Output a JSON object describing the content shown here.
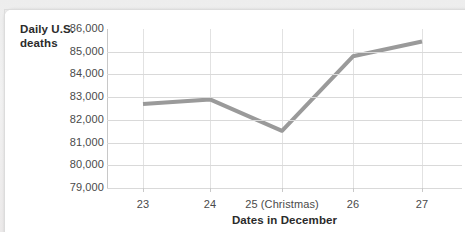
{
  "chart_data": {
    "type": "line",
    "title": "",
    "ylabel": "Daily U.S.\ndeaths",
    "ylabel_line1": "Daily U.S.",
    "ylabel_line2": "deaths",
    "xlabel": "Dates in December",
    "categories": [
      "23",
      "24",
      "25 (Christmas)",
      "26",
      "27"
    ],
    "x_tick_labels": [
      "23",
      "24",
      "25 (Christmas)",
      "26",
      "27"
    ],
    "y_tick_labels": [
      "86,000",
      "85,000",
      "84,000",
      "83,000",
      "82,000",
      "81,000",
      "80,000",
      "79,000"
    ],
    "y_tick_values": [
      86000,
      85000,
      84000,
      83000,
      82000,
      81000,
      80000,
      79000
    ],
    "ylim": [
      79000,
      86000
    ],
    "values": [
      82700,
      82900,
      81520,
      84800,
      85450
    ],
    "series": [
      {
        "name": "Daily U.S. deaths",
        "values": [
          82700,
          82900,
          81520,
          84800,
          85450
        ]
      }
    ],
    "grid": "horizontal-and-vertical",
    "legend": "none",
    "line_color": "#9a9a9a",
    "grid_color": "#d9d9d9",
    "axis_color": "#b9b9b9",
    "text_color": "#4a4a4a",
    "card_background": "#ffffff",
    "page_background": "#efefef"
  }
}
